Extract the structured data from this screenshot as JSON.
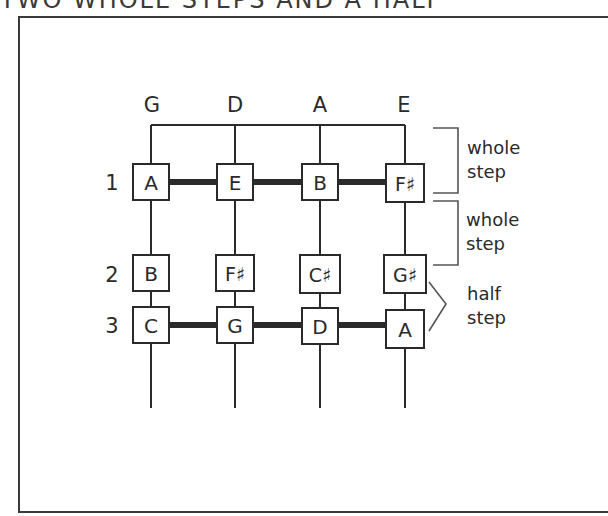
{
  "header": {
    "title": "TWO WHOLE STEPS AND A HALF"
  },
  "diagram": {
    "strings": [
      "G",
      "D",
      "A",
      "E"
    ],
    "frets": [
      {
        "number": "1",
        "notes": [
          "A",
          "E",
          "B",
          "F♯"
        ],
        "connected": true
      },
      {
        "number": "2",
        "notes": [
          "B",
          "F♯",
          "C♯",
          "G♯"
        ],
        "connected": false
      },
      {
        "number": "3",
        "notes": [
          "C",
          "G",
          "D",
          "A"
        ],
        "connected": true
      }
    ],
    "intervals": [
      {
        "line1": "whole",
        "line2": "step",
        "bracket": "square"
      },
      {
        "line1": "whole",
        "line2": "step",
        "bracket": "square"
      },
      {
        "line1": "half",
        "line2": "step",
        "bracket": "angle"
      }
    ],
    "colors": {
      "line": "#2a2a2a",
      "background": "#ffffff"
    }
  }
}
